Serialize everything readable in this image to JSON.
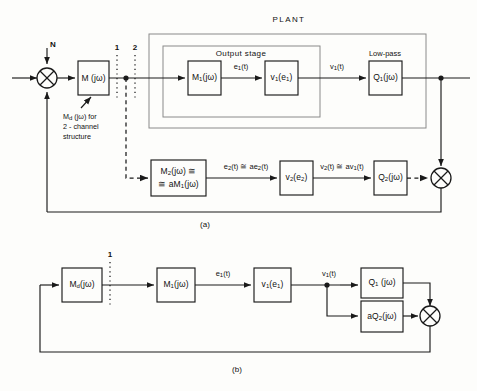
{
  "figure": {
    "caption_a": "(a)",
    "caption_b": "(b)"
  },
  "diagram_a": {
    "plant_label": "PLANT",
    "output_stage_label": "Output stage",
    "lowpass_label": "Low-pass",
    "noise_input": "N",
    "channel_1": "1",
    "channel_2": "2",
    "annotation": {
      "line1": "Md (jω) for",
      "line1_main": "M",
      "line1_sub": "d",
      "line1_rest": " (jω) for",
      "line2": "2 - channel",
      "line3": "structure"
    },
    "blocks": {
      "m": {
        "main": "M",
        "sub": "",
        "rest": " (jω)"
      },
      "m1": {
        "main": "M",
        "sub": "1",
        "rest": "(jω)"
      },
      "v1": {
        "main": "v",
        "sub": "1",
        "rest": "(e",
        "sub2": "1",
        "rest2": ")"
      },
      "q1": {
        "main": "Q",
        "sub": "1",
        "rest": "(jω)"
      },
      "m2_line1": {
        "main": "M",
        "sub": "2",
        "rest": "(jω) ≅"
      },
      "m2_line2": {
        "pre": "≅ aM",
        "sub": "1",
        "rest": "(jω)"
      },
      "v2": {
        "main": "v",
        "sub": "2",
        "rest": "(e",
        "sub2": "2",
        "rest2": ")"
      },
      "q2": {
        "main": "Q",
        "sub": "2",
        "rest": "(jω)"
      }
    },
    "signals": {
      "e1": {
        "main": "e",
        "sub": "1",
        "rest": "(t)"
      },
      "v1t": {
        "main": "v",
        "sub": "1",
        "rest": "(t)"
      },
      "e2": {
        "main": "e",
        "sub": "2",
        "rest": "(t) ≅ ae",
        "sub2": "2",
        "rest2": "(t)"
      },
      "v2t": {
        "main": "v",
        "sub": "2",
        "rest": "(t) ≅ av",
        "sub2": "1",
        "rest2": "(t)"
      }
    }
  },
  "diagram_b": {
    "channel_1": "1",
    "blocks": {
      "md": {
        "main": "M",
        "sub": "d",
        "rest": "(jω)"
      },
      "m1": {
        "main": "M",
        "sub": "1",
        "rest": "(jω)"
      },
      "v1": {
        "main": "v",
        "sub": "1",
        "rest": "(e",
        "sub2": "1",
        "rest2": ")"
      },
      "q1": {
        "main": "Q",
        "sub": "1",
        "rest": " (jω)"
      },
      "aq2": {
        "pre": "aQ",
        "sub": "2",
        "rest": "(jω)"
      }
    },
    "signals": {
      "e1": {
        "main": "e",
        "sub": "1",
        "rest": "(t)"
      },
      "v1t": {
        "main": "v",
        "sub": "1",
        "rest": "(t)"
      }
    }
  },
  "colors": {
    "stroke": "#1a1a1a",
    "light_stroke": "#6b6b6b",
    "background": "#fdfdfb"
  }
}
